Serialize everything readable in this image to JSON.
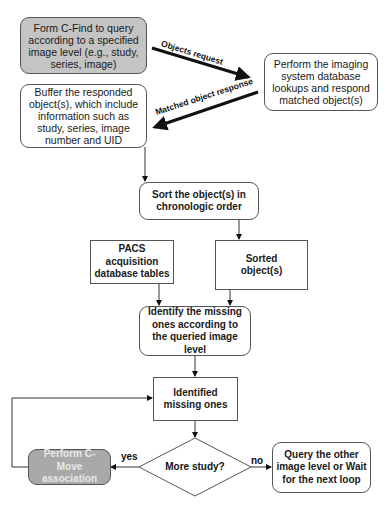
{
  "nodes": {
    "form_cfind": "Form C-Find to query according to a specified image level (e.g., study, series, image)",
    "perform_lookup": "Perform the imaging system database lookups and respond matched object(s)",
    "buffer": "Buffer the responded object(s), which include information such as study, series, image number and UID",
    "sort": "Sort the object(s) in chronologic order",
    "pacs_tables": "PACS acquisition database tables",
    "sorted_objects": "Sorted object(s)",
    "identify": "Identify the missing ones according to the queried image level",
    "identified": "Identified missing ones",
    "decision": "More study?",
    "cmove": "Perform C-Move association",
    "query_other": "Query the other image level or Wait for the next loop"
  },
  "edges": {
    "objects_request": "Objects request",
    "matched_response": "Matched object response",
    "yes": "yes",
    "no": "no"
  },
  "colors": {
    "form_fill": "#c4c4c4",
    "cmove_fill": "#a9a9a9",
    "stroke": "#555555"
  }
}
